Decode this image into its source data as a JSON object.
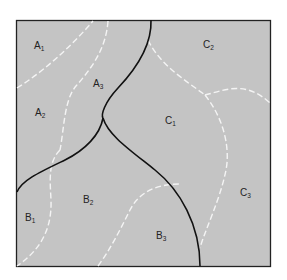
{
  "diagram": {
    "background": "#c4c4c4",
    "border_color": "#222222",
    "solid_line_color": "#111111",
    "dashed_line_color": "#f4f4f4",
    "regions": [
      {
        "id": "A1",
        "base": "A",
        "sub": "1",
        "x": 34,
        "y": 49
      },
      {
        "id": "A2",
        "base": "A",
        "sub": "2",
        "x": 35,
        "y": 116
      },
      {
        "id": "A3",
        "base": "A",
        "sub": "3",
        "x": 93,
        "y": 87
      },
      {
        "id": "B1",
        "base": "B",
        "sub": "1",
        "x": 25,
        "y": 221
      },
      {
        "id": "B2",
        "base": "B",
        "sub": "2",
        "x": 83,
        "y": 203
      },
      {
        "id": "B3",
        "base": "B",
        "sub": "3",
        "x": 156,
        "y": 239
      },
      {
        "id": "C1",
        "base": "C",
        "sub": "1",
        "x": 165,
        "y": 124
      },
      {
        "id": "C2",
        "base": "C",
        "sub": "2",
        "x": 203,
        "y": 48
      },
      {
        "id": "C3",
        "base": "C",
        "sub": "3",
        "x": 240,
        "y": 196
      }
    ]
  }
}
